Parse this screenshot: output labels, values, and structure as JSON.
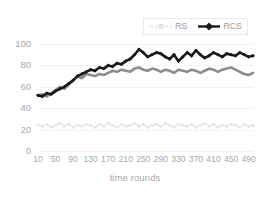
{
  "chart_data": {
    "type": "line",
    "title": "",
    "xlabel": "time rounds",
    "ylabel": "replica utilization",
    "xlim": [
      10,
      500
    ],
    "ylim": [
      0,
      100
    ],
    "grid": true,
    "legend_position": "top-center-right",
    "x_ticks": [
      10,
      50,
      90,
      130,
      170,
      210,
      250,
      290,
      330,
      370,
      410,
      450,
      490
    ],
    "y_ticks": [
      0,
      20,
      40,
      60,
      80,
      100
    ],
    "series": [
      {
        "name": "RS",
        "color": "#e2e2e2",
        "marker": "square",
        "linestyle": "dashed",
        "x": [
          10,
          20,
          30,
          40,
          50,
          60,
          70,
          80,
          90,
          100,
          110,
          120,
          130,
          140,
          150,
          160,
          170,
          180,
          190,
          200,
          210,
          220,
          230,
          240,
          250,
          260,
          270,
          280,
          290,
          300,
          310,
          320,
          330,
          340,
          350,
          360,
          370,
          380,
          390,
          400,
          410,
          420,
          430,
          440,
          450,
          460,
          470,
          480,
          490,
          500
        ],
        "values": [
          24,
          23,
          25,
          22,
          24,
          26,
          23,
          25,
          22,
          24,
          23,
          25,
          24,
          22,
          25,
          23,
          26,
          24,
          22,
          25,
          23,
          24,
          26,
          23,
          25,
          22,
          24,
          25,
          23,
          26,
          24,
          22,
          25,
          24,
          23,
          25,
          22,
          24,
          26,
          23,
          25,
          22,
          24,
          23,
          25,
          24,
          22,
          25,
          23,
          24
        ]
      },
      {
        "name": "RS-upper",
        "color": "#8c8c8c",
        "marker": "none",
        "linestyle": "solid",
        "x": [
          10,
          20,
          30,
          40,
          50,
          60,
          70,
          80,
          90,
          100,
          110,
          120,
          130,
          140,
          150,
          160,
          170,
          180,
          190,
          200,
          210,
          220,
          230,
          240,
          250,
          260,
          270,
          280,
          290,
          300,
          310,
          320,
          330,
          340,
          350,
          360,
          370,
          380,
          390,
          400,
          410,
          420,
          430,
          440,
          450,
          460,
          470,
          480,
          490,
          500
        ],
        "values": [
          52,
          53,
          51,
          54,
          57,
          60,
          58,
          62,
          66,
          70,
          68,
          72,
          71,
          70,
          72,
          71,
          73,
          75,
          74,
          76,
          75,
          74,
          77,
          78,
          76,
          75,
          77,
          76,
          74,
          76,
          75,
          73,
          76,
          75,
          74,
          76,
          75,
          73,
          75,
          77,
          76,
          74,
          76,
          77,
          78,
          76,
          74,
          72,
          71,
          73
        ]
      },
      {
        "name": "RCS",
        "color": "#1a1a1a",
        "marker": "diamond",
        "linestyle": "solid",
        "x": [
          10,
          20,
          30,
          40,
          50,
          60,
          70,
          80,
          90,
          100,
          110,
          120,
          130,
          140,
          150,
          160,
          170,
          180,
          190,
          200,
          210,
          220,
          230,
          240,
          250,
          260,
          270,
          280,
          290,
          300,
          310,
          320,
          330,
          340,
          350,
          360,
          370,
          380,
          390,
          400,
          410,
          420,
          430,
          440,
          450,
          460,
          470,
          480,
          490,
          500
        ],
        "values": [
          52,
          51,
          54,
          53,
          56,
          58,
          60,
          63,
          66,
          70,
          72,
          74,
          76,
          75,
          78,
          77,
          80,
          79,
          82,
          81,
          84,
          86,
          90,
          95,
          92,
          88,
          90,
          92,
          91,
          88,
          86,
          90,
          84,
          88,
          92,
          89,
          94,
          90,
          87,
          89,
          92,
          90,
          88,
          91,
          90,
          89,
          92,
          90,
          88,
          89
        ]
      }
    ]
  },
  "axes": {
    "x_title": "time rounds",
    "y_title": "replica utilization",
    "x_tick_labels": [
      "10",
      "50",
      "90",
      "130",
      "170",
      "210",
      "250",
      "290",
      "330",
      "370",
      "410",
      "450",
      "490"
    ],
    "y_tick_labels": [
      "100",
      "80",
      "60",
      "40",
      "20",
      "0"
    ]
  },
  "legend": {
    "items": [
      {
        "label": "RS",
        "color": "#e2e2e2",
        "marker": "square"
      },
      {
        "label": "RCS",
        "color": "#1a1a1a",
        "marker": "diamond"
      }
    ]
  },
  "colors": {
    "rs": "#e2e2e2",
    "rs_upper": "#8c8c8c",
    "rcs": "#1a1a1a",
    "grid": "#f2f2f2",
    "text": "#a8a8a8",
    "background": "#ffffff"
  }
}
